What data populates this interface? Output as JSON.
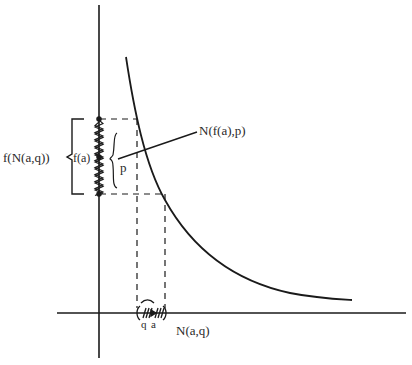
{
  "diagram": {
    "stroke_color": "#1a1a1a",
    "background": "#ffffff",
    "labels": {
      "f_N_a_q": "f(N(a,q))",
      "f_a": "f(a)",
      "p": "p",
      "N_f_a_p": "N(f(a),p)",
      "q": "q",
      "a": "a",
      "N_a_q": "N(a,q)"
    },
    "elements": {
      "y_axis": "vertical axis",
      "x_axis": "horizontal axis",
      "curve": "decreasing function curve f",
      "neighborhood_x": "hatched interval N(a,q) on horizontal axis",
      "neighborhood_y": "hatched interval f(N(a,q)) on vertical axis"
    }
  }
}
